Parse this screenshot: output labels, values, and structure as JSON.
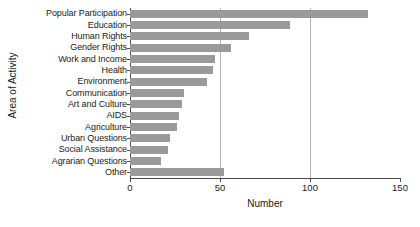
{
  "chart_data": {
    "type": "bar",
    "orientation": "horizontal",
    "title": "",
    "xlabel": "Number",
    "ylabel": "Area of Activity",
    "xlim": [
      0,
      150
    ],
    "xticks": [
      0,
      50,
      100,
      150
    ],
    "xtick_labels": [
      "0",
      "50",
      "100",
      "150"
    ],
    "grid": "vertical",
    "legend": "none",
    "bar_color": "#9a9a9a",
    "axis_color": "#4a4a4a",
    "categories": [
      "Popular Participation",
      "Education",
      "Human Rights",
      "Gender Rights",
      "Work and Income",
      "Health",
      "Environment",
      "Communication",
      "Art and Culture",
      "AIDS",
      "Agriculture",
      "Urban Questions",
      "Social Assistance",
      "Agrarian Questions",
      "Other"
    ],
    "values": [
      132,
      89,
      66,
      56,
      47,
      46,
      43,
      30,
      29,
      27,
      26,
      22,
      21,
      17,
      52
    ]
  }
}
